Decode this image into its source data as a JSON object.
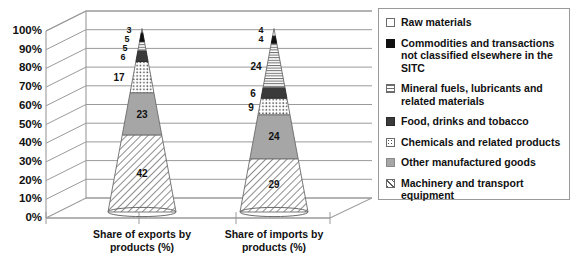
{
  "chart_data": {
    "type": "bar",
    "subtype": "stacked-3d-cone",
    "title": "",
    "xlabel": "",
    "ylabel": "",
    "ylim": [
      0,
      100
    ],
    "grid": true,
    "legend_position": "right",
    "categories": [
      "Share of exports by products (%)",
      "Share of imports by products (%)"
    ],
    "tick_labels": [
      "0%",
      "10%",
      "20%",
      "30%",
      "40%",
      "50%",
      "60%",
      "70%",
      "80%",
      "90%",
      "100%"
    ],
    "series": [
      {
        "name": "Machinery and transport equipment",
        "pattern": "diagonal-hatch",
        "values": [
          42,
          29
        ]
      },
      {
        "name": "Other manufactured goods",
        "pattern": "solid-gray",
        "values": [
          23,
          24
        ]
      },
      {
        "name": "Chemicals and related products",
        "pattern": "dots",
        "values": [
          17,
          9
        ]
      },
      {
        "name": "Food, drinks and tobacco",
        "pattern": "solid-dark",
        "values": [
          6,
          6
        ]
      },
      {
        "name": "Mineral fuels, lubricants and related materials",
        "pattern": "horizontal-lines",
        "values": [
          5,
          24
        ]
      },
      {
        "name": "Commodities and transactions not classified elsewhere in the SITC",
        "pattern": "solid-black",
        "values": [
          5,
          4
        ]
      },
      {
        "name": "Raw materials",
        "pattern": "white",
        "values": [
          3,
          4
        ]
      }
    ],
    "data_labels": {
      "exports": [
        "42",
        "23",
        "17",
        "6",
        "5",
        "5",
        "3"
      ],
      "imports": [
        "29",
        "24",
        "9",
        "6",
        "24",
        "4",
        "4"
      ]
    }
  },
  "axis": {
    "y_ticks": [
      "100%",
      "90%",
      "80%",
      "70%",
      "60%",
      "50%",
      "40%",
      "30%",
      "20%",
      "10%",
      "0%"
    ]
  },
  "categories": [
    {
      "line1": "Share of exports by",
      "line2": "products (%)"
    },
    {
      "line1": "Share of imports by",
      "line2": "products (%)"
    }
  ],
  "legend": {
    "items": [
      {
        "label": "Raw materials",
        "pattern": "white"
      },
      {
        "label": "Commodities and transactions not classified elsewhere in the SITC",
        "pattern": "solid-black"
      },
      {
        "label": "Mineral fuels, lubricants and related materials",
        "pattern": "horizontal-lines"
      },
      {
        "label": "Food, drinks and tobacco",
        "pattern": "solid-dark"
      },
      {
        "label": "Chemicals and related products",
        "pattern": "dots"
      },
      {
        "label": "Other manufactured goods",
        "pattern": "solid-gray"
      },
      {
        "label": "Machinery and transport equipment",
        "pattern": "diagonal-hatch"
      }
    ]
  },
  "labels": {
    "exports": {
      "v42": "42",
      "v23": "23",
      "v17": "17",
      "v6": "6",
      "v5a": "5",
      "v5b": "5",
      "v3": "3"
    },
    "imports": {
      "v29": "29",
      "v24a": "24",
      "v9": "9",
      "v6": "6",
      "v24b": "24",
      "v4a": "4",
      "v4b": "4"
    }
  },
  "colors": {
    "gridline": "#9a9a9a",
    "gray_fill": "#a6a6a6",
    "dark_fill": "#3a3a3a",
    "black_fill": "#111111",
    "outline": "#6b6b6b",
    "legend_border": "#9a9a9a"
  }
}
